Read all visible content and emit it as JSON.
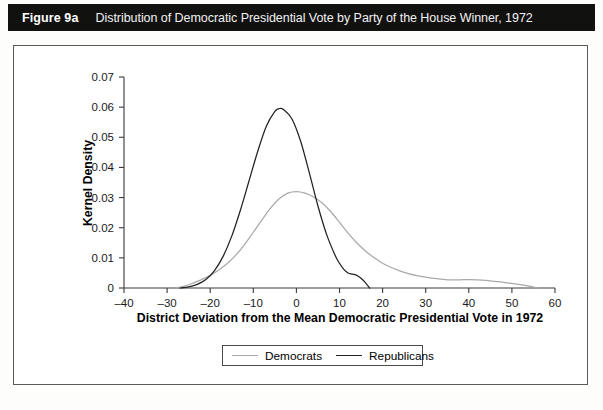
{
  "header": {
    "figure_number": "Figure 9a",
    "caption": "Distribution of Democratic Presidential Vote by Party of the House Winner, 1972",
    "background_color": "#111110",
    "text_color": "#ffffff"
  },
  "legend": {
    "position": "below-axis",
    "entries": [
      {
        "label": "Democrats",
        "color": "#a9a9a9"
      },
      {
        "label": "Republicans",
        "color": "#222222"
      }
    ]
  },
  "chart_data": {
    "type": "line",
    "title": "Distribution of Democratic Presidential Vote by Party of the House Winner, 1972",
    "xlabel": "District Deviation from the Mean Democratic Presidential Vote in 1972",
    "ylabel": "Kernel Density",
    "xlim": [
      -40,
      60
    ],
    "ylim": [
      0,
      0.07
    ],
    "xticks": [
      -40,
      -30,
      -20,
      -10,
      0,
      10,
      20,
      30,
      40,
      50,
      60
    ],
    "xtick_labels": [
      "–40",
      "–30",
      "–20",
      "–10",
      "0",
      "10",
      "20",
      "30",
      "40",
      "50",
      "60"
    ],
    "yticks": [
      0,
      0.01,
      0.02,
      0.03,
      0.04,
      0.05,
      0.06,
      0.07
    ],
    "ytick_labels": [
      "0",
      "0.01",
      "0.02",
      "0.03",
      "0.04",
      "0.05",
      "0.06",
      "0.07"
    ],
    "grid": false,
    "legend_position": "below",
    "series": [
      {
        "name": "Democrats",
        "color": "#a9a9a9",
        "x": [
          -28,
          -26,
          -24,
          -22,
          -20,
          -18,
          -16,
          -14,
          -12,
          -10,
          -8,
          -6,
          -4,
          -2,
          0,
          2,
          4,
          6,
          8,
          10,
          12,
          14,
          16,
          18,
          20,
          22,
          24,
          26,
          28,
          30,
          32,
          34,
          36,
          38,
          40,
          42,
          44,
          46,
          48,
          50,
          52,
          54,
          56
        ],
        "y": [
          0.0,
          0.0006,
          0.0016,
          0.0028,
          0.0042,
          0.006,
          0.0082,
          0.011,
          0.0145,
          0.0185,
          0.0226,
          0.0265,
          0.0296,
          0.0315,
          0.032,
          0.0315,
          0.0302,
          0.0282,
          0.0253,
          0.0218,
          0.0182,
          0.015,
          0.0123,
          0.0101,
          0.0082,
          0.0068,
          0.0057,
          0.0048,
          0.0041,
          0.0036,
          0.0032,
          0.0029,
          0.0027,
          0.0027,
          0.0028,
          0.0027,
          0.0025,
          0.0022,
          0.0019,
          0.0015,
          0.0011,
          0.0006,
          0.0
        ]
      },
      {
        "name": "Republicans",
        "color": "#222222",
        "x": [
          -27,
          -25,
          -23,
          -21,
          -19,
          -17,
          -15,
          -13,
          -11,
          -9,
          -7,
          -5,
          -4,
          -3,
          -1,
          1,
          3,
          5,
          7,
          9,
          10,
          11,
          12,
          13,
          14,
          15,
          16,
          17
        ],
        "y": [
          0.0,
          0.0004,
          0.0012,
          0.0028,
          0.0058,
          0.0105,
          0.0172,
          0.0258,
          0.0355,
          0.0452,
          0.0536,
          0.0586,
          0.0595,
          0.0592,
          0.056,
          0.0486,
          0.0382,
          0.0272,
          0.0178,
          0.0108,
          0.0082,
          0.0062,
          0.005,
          0.0046,
          0.0042,
          0.0032,
          0.0018,
          0.0
        ]
      }
    ],
    "annotations": {
      "democrat_peak": {
        "x": 0,
        "y": 0.032
      },
      "republican_peak": {
        "x": -4,
        "y": 0.0595
      },
      "democrat_secondary_bump": {
        "x": 40,
        "y": 0.0028
      }
    }
  }
}
